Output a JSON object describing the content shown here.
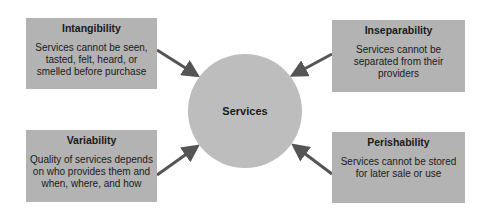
{
  "center": {
    "label": "Services"
  },
  "boxes": [
    {
      "title": "Intangibility",
      "description": "Services cannot be seen, tasted, felt, heard, or smelled before purchase"
    },
    {
      "title": "Inseparability",
      "description": "Services cannot be separated from their providers"
    },
    {
      "title": "Variability",
      "description": "Quality of services depends on who provides them and when, where, and how"
    },
    {
      "title": "Perishability",
      "description": "Services cannot be stored for later sale or use"
    }
  ],
  "colors": {
    "box": "#b3b3b3",
    "circle": "#bdbdbd",
    "arrow": "#555555",
    "text": "#1a1a1a"
  }
}
